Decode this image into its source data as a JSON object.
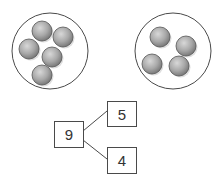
{
  "diagram": {
    "type": "number-bond",
    "groups": [
      {
        "name": "left-group",
        "count": 5,
        "cx": 50,
        "cy": 51,
        "r": 38,
        "counters": [
          [
            42,
            31
          ],
          [
            63,
            37
          ],
          [
            29,
            49
          ],
          [
            52,
            57
          ],
          [
            42,
            75
          ]
        ]
      },
      {
        "name": "right-group",
        "count": 4,
        "cx": 173,
        "cy": 51,
        "r": 38,
        "counters": [
          [
            160,
            37
          ],
          [
            186,
            46
          ],
          [
            152,
            64
          ],
          [
            179,
            66
          ]
        ]
      }
    ],
    "whole": "9",
    "parts": [
      "5",
      "4"
    ]
  },
  "colors": {
    "outline": "#4a4a4a",
    "counter_light": "#d6d6d6",
    "counter_dark": "#7a7a7a"
  }
}
